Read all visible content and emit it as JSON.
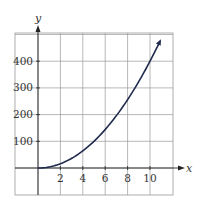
{
  "chart_data": {
    "type": "line",
    "title": "",
    "xlabel": "x",
    "ylabel": "y",
    "xlim": [
      -2,
      12
    ],
    "ylim": [
      -100,
      500
    ],
    "grid": true,
    "x_ticks": [
      2,
      4,
      6,
      8,
      10
    ],
    "x_tick_labels": [
      "2",
      "4",
      "6",
      "8",
      "10"
    ],
    "y_ticks": [
      100,
      200,
      300,
      400
    ],
    "y_tick_labels": [
      "100",
      "200",
      "300",
      "400"
    ],
    "series": [
      {
        "name": "y = 4x^2",
        "x": [
          0,
          1,
          2,
          3,
          4,
          5,
          6,
          7,
          8,
          9,
          10,
          10.9
        ],
        "y": [
          0,
          4,
          16,
          36,
          64,
          100,
          144,
          196,
          256,
          324,
          400,
          475
        ]
      }
    ],
    "colors": {
      "curve": "#1f2a4d",
      "grid": "#9a9a9a",
      "axis": "#222222"
    }
  }
}
